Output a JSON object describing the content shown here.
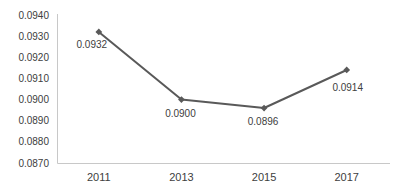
{
  "chart_data": {
    "type": "line",
    "title": "",
    "xlabel": "",
    "ylabel": "",
    "categories": [
      "2011",
      "2013",
      "2015",
      "2017"
    ],
    "values": [
      0.0932,
      0.09,
      0.0896,
      0.0914
    ],
    "data_labels": [
      "0.0932",
      "0.0900",
      "0.0896",
      "0.0914"
    ],
    "y_tick_labels": [
      "0.0940",
      "0.0930",
      "0.0920",
      "0.0910",
      "0.0900",
      "0.0890",
      "0.0880",
      "0.0870"
    ],
    "ylim": [
      0.087,
      0.094
    ],
    "grid": false,
    "legend": "none",
    "marker_shape": "diamond",
    "colors": {
      "line": "#595959",
      "marker": "#595959",
      "axis": "#c8c8c8",
      "tick_text": "#404040",
      "data_label_text": "#404040",
      "background": "#ffffff"
    }
  }
}
